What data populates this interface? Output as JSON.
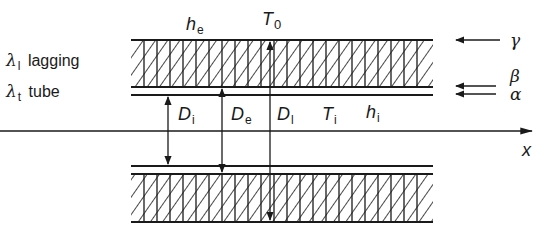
{
  "diagram": {
    "colors": {
      "stroke": "#1a1a1a",
      "background": "#ffffff"
    },
    "legend": [
      {
        "symbol": "λ",
        "subscript": "l",
        "label": "lagging"
      },
      {
        "symbol": "λ",
        "subscript": "t",
        "label": "tube"
      }
    ],
    "top_labels": {
      "he": {
        "main": "h",
        "sub": "e"
      },
      "T0": {
        "main": "T",
        "sub": "0"
      }
    },
    "inner_labels": [
      {
        "main": "D",
        "sub": "i"
      },
      {
        "main": "D",
        "sub": "e"
      },
      {
        "main": "D",
        "sub": "l"
      },
      {
        "main": "T",
        "sub": "i"
      },
      {
        "main": "h",
        "sub": "i"
      }
    ],
    "axis_label": "x",
    "right_labels": {
      "gamma": "γ",
      "beta": "β",
      "alpha": "α"
    }
  }
}
